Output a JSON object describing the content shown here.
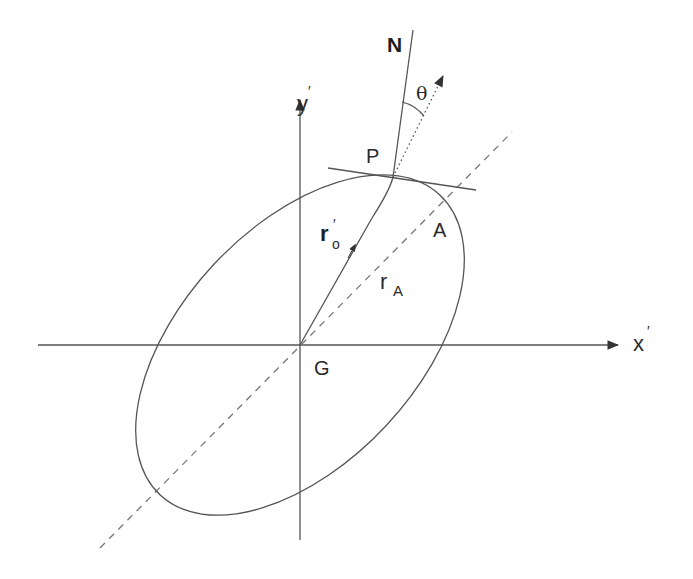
{
  "figure": {
    "type": "geometry-diagram",
    "colors": {
      "line": "#555555",
      "text": "#2a2a2a",
      "background": "#ffffff"
    }
  },
  "axes": {
    "x_label": "x",
    "x_prime": "′",
    "y_label": "y",
    "y_prime": "′",
    "origin_label": "G"
  },
  "points": {
    "P": "P",
    "A": "A",
    "N": "N"
  },
  "vectors": {
    "r0_main": "r",
    "r0_sub": "o",
    "r0_prime": "′",
    "rA_main": "r",
    "rA_sub": "A"
  },
  "angles": {
    "theta": "θ"
  }
}
